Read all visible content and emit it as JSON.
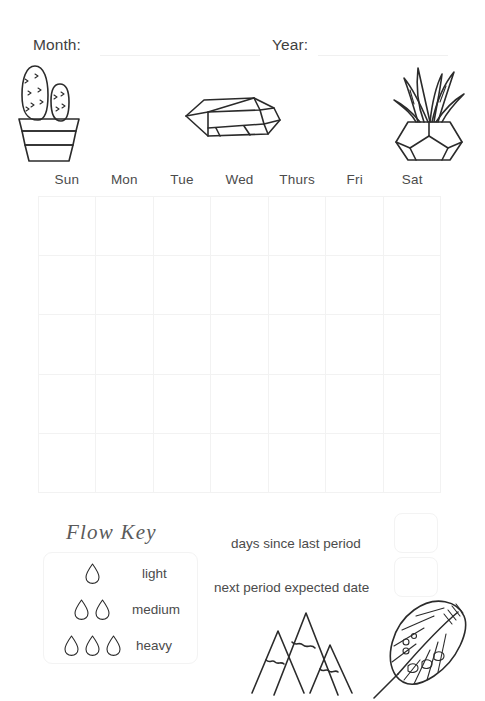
{
  "header": {
    "month_label": "Month:",
    "year_label": "Year:"
  },
  "calendar": {
    "weekdays": [
      "Sun",
      "Mon",
      "Tue",
      "Wed",
      "Thurs",
      "Fri",
      "Sat"
    ],
    "rows": 5,
    "columns": 7,
    "cells": [
      "",
      "",
      "",
      "",
      "",
      "",
      "",
      "",
      "",
      "",
      "",
      "",
      "",
      "",
      "",
      "",
      "",
      "",
      "",
      "",
      "",
      "",
      "",
      "",
      "",
      "",
      "",
      "",
      "",
      "",
      "",
      "",
      "",
      "",
      ""
    ]
  },
  "flow_key": {
    "title": "Flow Key",
    "levels": [
      {
        "label": "light",
        "drops": 1
      },
      {
        "label": "medium",
        "drops": 2
      },
      {
        "label": "heavy",
        "drops": 3
      }
    ]
  },
  "tracking": {
    "days_since_label": "days since last period",
    "days_since_value": "",
    "next_date_label": "next period expected date",
    "next_date_value": ""
  },
  "illustrations": [
    {
      "name": "cactus-in-pot",
      "position": "top-left"
    },
    {
      "name": "crystal-gem",
      "position": "top-center"
    },
    {
      "name": "potted-plant",
      "position": "top-right"
    },
    {
      "name": "mountains",
      "position": "bottom-center"
    },
    {
      "name": "feather",
      "position": "bottom-right"
    }
  ],
  "colors": {
    "ink": "#2b2b2b",
    "text": "#4b4b4b",
    "grid_line": "#f2f2f2",
    "background": "#ffffff"
  }
}
